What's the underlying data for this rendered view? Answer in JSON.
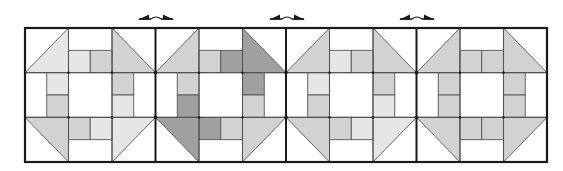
{
  "figure": {
    "frame": {
      "x": 25,
      "y": 28,
      "width": 522,
      "height": 134
    },
    "block_count": 4,
    "seam_arrows": [
      {
        "x": 156
      },
      {
        "x": 287
      },
      {
        "x": 417
      }
    ],
    "colors": {
      "W": "#ffffff",
      "L": "#e6e6e6",
      "M": "#d2d2d2",
      "D": "#a0a0a0",
      "line": "#555555",
      "frame": "#1a1a1a"
    },
    "blocks": [
      {
        "name": "block-1",
        "corners": {
          "tl": "L",
          "tr": "M",
          "bl": "M",
          "br": "L"
        },
        "top": [
          "L",
          "M"
        ],
        "left": [
          "L",
          "M"
        ],
        "right": [
          "M",
          "L"
        ],
        "bottom": [
          "M",
          "L"
        ]
      },
      {
        "name": "block-2",
        "corners": {
          "tl": "M",
          "tr": "D",
          "bl": "D",
          "br": "M"
        },
        "top": [
          "M",
          "D"
        ],
        "left": [
          "M",
          "D"
        ],
        "right": [
          "D",
          "M"
        ],
        "bottom": [
          "D",
          "M"
        ]
      },
      {
        "name": "block-3",
        "corners": {
          "tl": "M",
          "tr": "M",
          "bl": "M",
          "br": "L"
        },
        "top": [
          "L",
          "M"
        ],
        "left": [
          "L",
          "M"
        ],
        "right": [
          "M",
          "L"
        ],
        "bottom": [
          "M",
          "L"
        ]
      },
      {
        "name": "block-4",
        "corners": {
          "tl": "M",
          "tr": "M",
          "bl": "M",
          "br": "M"
        },
        "top": [
          "M",
          "M"
        ],
        "left": [
          "M",
          "M"
        ],
        "right": [
          "M",
          "M"
        ],
        "bottom": [
          "M",
          "M"
        ]
      }
    ]
  }
}
